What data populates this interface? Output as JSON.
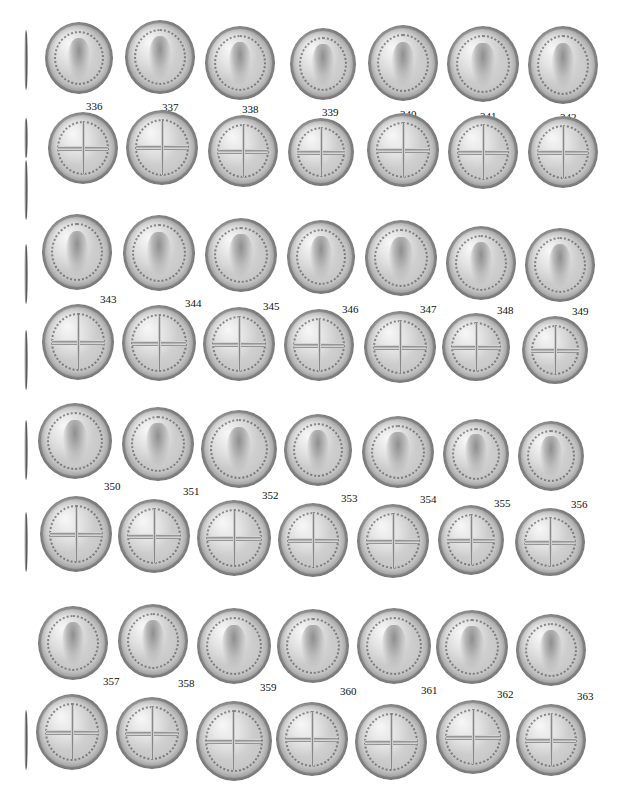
{
  "plate": {
    "header_text": "",
    "rows": [
      {
        "type": "obverse",
        "numbers": [
          "336",
          "337",
          "338",
          "339",
          "340",
          "341",
          "342"
        ],
        "coins": [
          [
            45,
            22,
            68,
            72
          ],
          [
            125,
            20,
            70,
            74
          ],
          [
            205,
            26,
            70,
            74
          ],
          [
            290,
            28,
            66,
            72
          ],
          [
            368,
            25,
            70,
            76
          ],
          [
            447,
            26,
            72,
            76
          ],
          [
            528,
            26,
            70,
            78
          ]
        ],
        "labels": [
          [
            86,
            100
          ],
          [
            162,
            101
          ],
          [
            242,
            103
          ],
          [
            322,
            106
          ],
          [
            400,
            108
          ],
          [
            480,
            110
          ],
          [
            560,
            111
          ]
        ]
      },
      {
        "type": "reverse",
        "numbers": [],
        "coins": [
          [
            48,
            112,
            70,
            72
          ],
          [
            126,
            110,
            72,
            75
          ],
          [
            208,
            115,
            70,
            72
          ],
          [
            288,
            118,
            66,
            68
          ],
          [
            367,
            113,
            72,
            74
          ],
          [
            448,
            115,
            70,
            74
          ],
          [
            528,
            116,
            70,
            72
          ]
        ],
        "labels": []
      },
      {
        "type": "obverse",
        "numbers": [
          "343",
          "344",
          "345",
          "346",
          "347",
          "348",
          "349"
        ],
        "coins": [
          [
            42,
            214,
            70,
            76
          ],
          [
            123,
            215,
            72,
            76
          ],
          [
            205,
            218,
            72,
            74
          ],
          [
            287,
            220,
            68,
            74
          ],
          [
            365,
            220,
            72,
            76
          ],
          [
            446,
            226,
            70,
            74
          ],
          [
            525,
            228,
            70,
            74
          ]
        ],
        "labels": [
          [
            100,
            293
          ],
          [
            185,
            297
          ],
          [
            263,
            300
          ],
          [
            342,
            303
          ],
          [
            420,
            303
          ],
          [
            497,
            304
          ],
          [
            572,
            305
          ]
        ]
      },
      {
        "type": "reverse",
        "numbers": [],
        "coins": [
          [
            42,
            304,
            72,
            76
          ],
          [
            122,
            305,
            74,
            76
          ],
          [
            203,
            307,
            72,
            74
          ],
          [
            284,
            309,
            70,
            72
          ],
          [
            364,
            311,
            72,
            72
          ],
          [
            442,
            313,
            68,
            68
          ],
          [
            522,
            316,
            66,
            68
          ]
        ],
        "labels": []
      },
      {
        "type": "obverse",
        "numbers": [
          "350",
          "351",
          "352",
          "353",
          "354",
          "355",
          "356"
        ],
        "coins": [
          [
            38,
            403,
            74,
            76
          ],
          [
            122,
            407,
            72,
            74
          ],
          [
            201,
            410,
            76,
            78
          ],
          [
            284,
            414,
            68,
            72
          ],
          [
            362,
            416,
            72,
            72
          ],
          [
            443,
            419,
            66,
            70
          ],
          [
            518,
            421,
            66,
            70
          ]
        ],
        "labels": [
          [
            104,
            480
          ],
          [
            183,
            485
          ],
          [
            262,
            489
          ],
          [
            341,
            492
          ],
          [
            420,
            493
          ],
          [
            494,
            497
          ],
          [
            571,
            498
          ]
        ]
      },
      {
        "type": "reverse",
        "numbers": [],
        "coins": [
          [
            40,
            496,
            72,
            76
          ],
          [
            118,
            499,
            72,
            74
          ],
          [
            197,
            500,
            74,
            76
          ],
          [
            278,
            503,
            70,
            74
          ],
          [
            357,
            504,
            72,
            74
          ],
          [
            438,
            505,
            66,
            70
          ],
          [
            515,
            508,
            70,
            68
          ]
        ],
        "labels": []
      },
      {
        "type": "obverse",
        "numbers": [
          "357",
          "358",
          "359",
          "360",
          "361",
          "362",
          "363"
        ],
        "coins": [
          [
            38,
            606,
            70,
            74
          ],
          [
            118,
            604,
            70,
            74
          ],
          [
            197,
            608,
            74,
            76
          ],
          [
            277,
            609,
            72,
            74
          ],
          [
            357,
            608,
            74,
            76
          ],
          [
            436,
            610,
            72,
            74
          ],
          [
            516,
            614,
            70,
            72
          ]
        ],
        "labels": [
          [
            103,
            675
          ],
          [
            178,
            677
          ],
          [
            260,
            681
          ],
          [
            340,
            685
          ],
          [
            421,
            684
          ],
          [
            497,
            688
          ],
          [
            577,
            690
          ]
        ]
      },
      {
        "type": "reverse",
        "numbers": [],
        "coins": [
          [
            36,
            694,
            72,
            76
          ],
          [
            116,
            697,
            72,
            72
          ],
          [
            196,
            701,
            76,
            80
          ],
          [
            276,
            702,
            72,
            74
          ],
          [
            355,
            704,
            72,
            76
          ],
          [
            436,
            700,
            74,
            74
          ],
          [
            516,
            704,
            70,
            72
          ]
        ],
        "labels": []
      }
    ],
    "edge_marks": [
      [
        30,
        60
      ],
      [
        118,
        40
      ],
      [
        160,
        60
      ],
      [
        244,
        60
      ],
      [
        330,
        60
      ],
      [
        420,
        60
      ],
      [
        512,
        60
      ],
      [
        710,
        60
      ]
    ]
  }
}
